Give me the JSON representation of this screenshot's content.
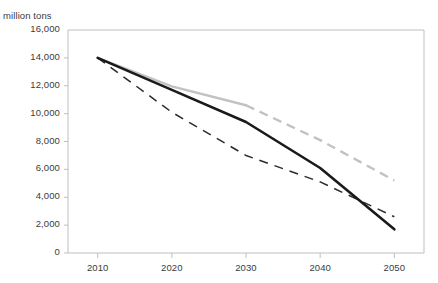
{
  "chart_data": {
    "type": "line",
    "title": "",
    "title_note": "title is clipped off the top edge of the screenshot and is not legible",
    "ylabel": "million tons",
    "xlabel": "",
    "x": [
      2010,
      2020,
      2030,
      2040,
      2050
    ],
    "xlim": [
      2006,
      2054
    ],
    "ylim": [
      0,
      16000
    ],
    "ytick_labels": [
      "16,000",
      "14,000",
      "12,000",
      "10,000",
      "8,000",
      "6,000",
      "4,000",
      "2,000",
      "0"
    ],
    "ytick_values": [
      16000,
      14000,
      12000,
      10000,
      8000,
      6000,
      4000,
      2000,
      0
    ],
    "xtick_labels": [
      "2010",
      "2020",
      "2030",
      "2040",
      "2050"
    ],
    "grid": false,
    "legend": "none",
    "series": [
      {
        "name": "solid-black-line",
        "color": "#1a1a1a",
        "style": "solid",
        "width": 2.6,
        "values": [
          14000,
          11700,
          9400,
          6100,
          1700
        ]
      },
      {
        "name": "gray-line",
        "color": "#c2c2c2",
        "style": "solid-then-dashed",
        "dash_begins_at_x": 2030,
        "width": 2.4,
        "values": [
          14000,
          11950,
          10600,
          8100,
          5200
        ]
      },
      {
        "name": "black-dashed-line",
        "color": "#2b2b2b",
        "style": "dashed",
        "width": 1.5,
        "values": [
          14000,
          10100,
          7000,
          5100,
          2600
        ]
      }
    ]
  },
  "axis": {
    "unit_label": "million tons",
    "axis_color": "#bfbfbf"
  }
}
